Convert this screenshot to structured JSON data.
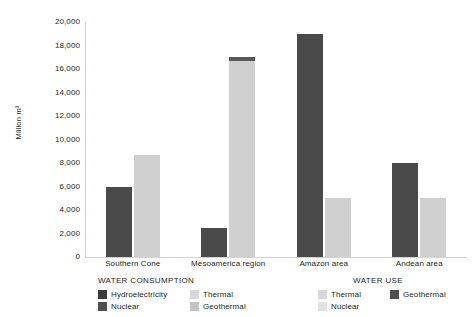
{
  "chart_data": {
    "type": "bar",
    "title": "",
    "xlabel": "",
    "ylabel": "Million m³",
    "ylim": [
      0,
      20000
    ],
    "ytick_step": 2000,
    "grid": false,
    "legend_position": "bottom",
    "categories": [
      "Southern Cone",
      "Mesoamerica region",
      "Amazon area",
      "Andean area"
    ],
    "ytick_labels": [
      "20,000",
      "18,000",
      "16,000",
      "14,000",
      "12,000",
      "10,000",
      "8,000",
      "6,000",
      "4,000",
      "2,000",
      "0"
    ],
    "ytick_values": [
      20000,
      18000,
      16000,
      14000,
      12000,
      10000,
      8000,
      6000,
      4000,
      2000,
      0
    ],
    "series": [
      {
        "name": "Water consumption",
        "color": "#4a4a4a",
        "values": [
          6000,
          2500,
          19000,
          8000
        ]
      },
      {
        "name": "Water use",
        "color": "#d0d0d0",
        "values": [
          8700,
          17000,
          5000,
          5000
        ],
        "stacked_caps": [
          null,
          {
            "from": 16700,
            "to": 17000,
            "color": "#595959"
          },
          null,
          null
        ]
      }
    ]
  },
  "legends": {
    "consumption": {
      "title": "WATER CONSUMPTION",
      "items": [
        {
          "label": "Hydroelectricity",
          "color": "#3b3b3b"
        },
        {
          "label": "Nuclear",
          "color": "#4f4f4f"
        },
        {
          "label": "Thermal",
          "color": "#d8d8d8"
        },
        {
          "label": "Geothermal",
          "color": "#c4c4c4"
        }
      ]
    },
    "use": {
      "title": "WATER USE",
      "items": [
        {
          "label": "Thermal",
          "color": "#d8d8d8"
        },
        {
          "label": "Nuclear",
          "color": "#e2e2e2"
        },
        {
          "label": "Geothermal",
          "color": "#4f4f4f"
        }
      ]
    }
  },
  "colors": {
    "background": "#ffffff",
    "axis": "#d2d2d2",
    "text": "#231f20",
    "bar_dark": "#4a4a4a",
    "bar_light": "#d0d0d0",
    "bar_cap": "#595959"
  }
}
